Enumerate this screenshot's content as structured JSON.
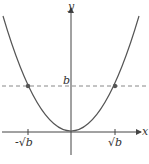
{
  "figure": {
    "type": "parabola graph",
    "curve": "y = x^2",
    "axes": {
      "x_label": "x",
      "y_label": "y"
    },
    "horizontal_line": {
      "label": "b",
      "style": "dashed"
    },
    "points": [
      {
        "label": "-√b"
      },
      {
        "label": "√b"
      }
    ],
    "colors": {
      "curve": "#555555",
      "dashed": "#888888",
      "axis": "#444444"
    }
  }
}
